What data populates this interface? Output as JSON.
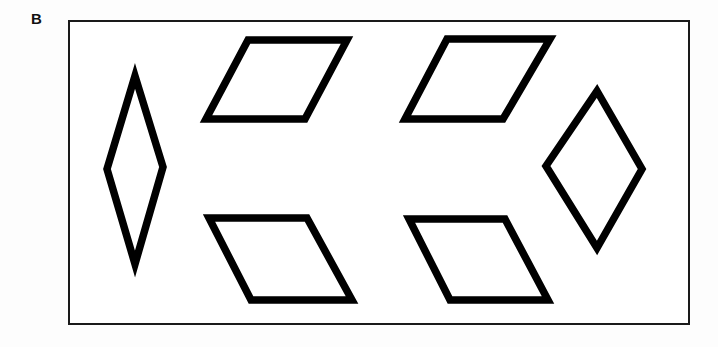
{
  "figure": {
    "panel_label": "B",
    "background_color": "#fdfdfd",
    "frame": {
      "name": "figure-border",
      "x": 68,
      "y": 20,
      "width": 622,
      "height": 305,
      "stroke_color": "#1a1a1a",
      "stroke_width": 2,
      "fill_color": "#ffffff"
    },
    "shape_style": {
      "stroke_color": "#000000",
      "stroke_width": 7.5,
      "fill_color": "#ffffff"
    },
    "shape_count": 6,
    "shapes": [
      {
        "id": "shape-1",
        "name": "tall-thin-rhombus-left",
        "type": "rhombus",
        "points": "135,76 163,167 135,264 107,169"
      },
      {
        "id": "shape-2",
        "name": "parallelogram-top-left",
        "type": "parallelogram",
        "points": "248,40 347,40 305,119 206,119"
      },
      {
        "id": "shape-3",
        "name": "parallelogram-top-right",
        "type": "parallelogram",
        "points": "447,39 550,39 503,119 405,119"
      },
      {
        "id": "shape-4",
        "name": "wide-rhombus-right",
        "type": "rhombus",
        "points": "597,91 642,169 597,248 546,166"
      },
      {
        "id": "shape-5",
        "name": "parallelogram-bottom-left",
        "type": "parallelogram",
        "points": "209,218 307,218 352,300 251,300"
      },
      {
        "id": "shape-6",
        "name": "parallelogram-bottom-right",
        "type": "parallelogram",
        "points": "409,219 505,219 548,300 450,300"
      }
    ]
  }
}
